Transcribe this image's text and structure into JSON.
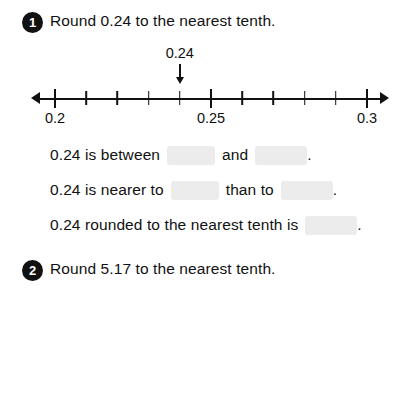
{
  "worksheet": {
    "questions": [
      {
        "number": "1",
        "title": "Round 0.24 to the nearest tenth.",
        "numberline": {
          "callout_label": "0.24",
          "callout_value": 0.24,
          "min": 0.2,
          "max": 0.3,
          "tick_step": 0.01,
          "labeled_ticks": [
            {
              "value": 0.2,
              "label": "0.2"
            },
            {
              "value": 0.25,
              "label": "0.25"
            },
            {
              "value": 0.3,
              "label": "0.3"
            }
          ]
        },
        "lines": [
          {
            "parts": [
              {
                "type": "text",
                "value": "0.24 is between"
              },
              {
                "type": "blank",
                "size": "short"
              },
              {
                "type": "text",
                "value": "and"
              },
              {
                "type": "blank",
                "size": "long"
              },
              {
                "type": "text",
                "value": "."
              }
            ]
          },
          {
            "parts": [
              {
                "type": "text",
                "value": "0.24 is nearer to"
              },
              {
                "type": "blank",
                "size": "short"
              },
              {
                "type": "text",
                "value": "than to"
              },
              {
                "type": "blank",
                "size": "long"
              },
              {
                "type": "text",
                "value": "."
              }
            ]
          },
          {
            "parts": [
              {
                "type": "text",
                "value": "0.24 rounded to the nearest tenth is"
              },
              {
                "type": "blank",
                "size": "long"
              },
              {
                "type": "text",
                "value": "."
              }
            ]
          }
        ]
      },
      {
        "number": "2",
        "title": "Round 5.17 to the nearest tenth.",
        "numberline": null,
        "lines": [
          {
            "parts": [
              {
                "type": "text",
                "value": "5.17 is between"
              },
              {
                "type": "blank",
                "size": "short"
              },
              {
                "type": "text",
                "value": "and 5.2."
              }
            ]
          },
          {
            "parts": [
              {
                "type": "text",
                "value": "5.17 is nearer to"
              },
              {
                "type": "blank",
                "size": "short"
              },
              {
                "type": "text",
                "value": "than to"
              },
              {
                "type": "blank",
                "size": "long"
              },
              {
                "type": "text",
                "value": "."
              }
            ]
          },
          {
            "parts": [
              {
                "type": "text",
                "value": "5.17 rounded to the nearest tenth is"
              },
              {
                "type": "blank",
                "size": "long"
              },
              {
                "type": "text",
                "value": "."
              }
            ]
          }
        ]
      }
    ],
    "colors": {
      "ink": "#111111",
      "blank_fill": "#ececec",
      "page": "#ffffff"
    }
  }
}
